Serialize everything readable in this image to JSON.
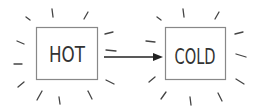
{
  "diagram": {
    "nodes": [
      {
        "id": "hot",
        "label": "HOT"
      },
      {
        "id": "cold",
        "label": "COLD"
      }
    ],
    "edges": [
      {
        "from": "hot",
        "to": "cold",
        "type": "arrow"
      }
    ],
    "colors": {
      "stroke": "#888888",
      "ray": "#444444",
      "arrow": "#222222",
      "text": "#333333"
    }
  }
}
